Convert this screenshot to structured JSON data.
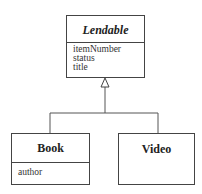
{
  "diagram": {
    "type": "uml-class-diagram",
    "classes": [
      {
        "name": "Lendable",
        "abstract": true,
        "attributes": [
          "itemNumber",
          "status",
          "title"
        ]
      },
      {
        "name": "Book",
        "abstract": false,
        "attributes": [
          "author"
        ]
      },
      {
        "name": "Video",
        "abstract": false,
        "attributes": []
      }
    ],
    "relationships": [
      {
        "type": "generalization",
        "from": "Book",
        "to": "Lendable"
      },
      {
        "type": "generalization",
        "from": "Video",
        "to": "Lendable"
      }
    ]
  }
}
